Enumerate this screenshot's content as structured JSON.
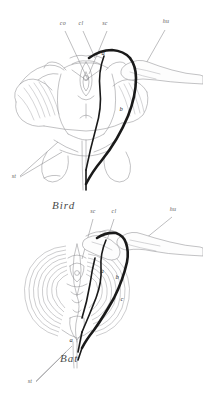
{
  "figure": {
    "title_visible": false,
    "kind": "comparative-anatomy-line-drawing",
    "background_color": "#ffffff",
    "line_color": "#8f8f93",
    "emphasis_color": "#1a1a1a",
    "text_color": "#4a4a4a",
    "panels": [
      {
        "id": "bird-panel",
        "caption": "Bird",
        "caption_pos": {
          "x": 52,
          "y": 208
        },
        "part_labels": [
          {
            "key": "co",
            "text": "co",
            "x": 63,
            "y": 25,
            "leader_to": {
              "x": 86,
              "y": 78
            }
          },
          {
            "key": "cl",
            "text": "cl",
            "x": 81,
            "y": 25,
            "leader_to": {
              "x": 93,
              "y": 56
            }
          },
          {
            "key": "sc",
            "text": "sc",
            "x": 105,
            "y": 25,
            "leader_to": {
              "x": 88,
              "y": 72
            }
          },
          {
            "key": "hu",
            "text": "hu",
            "x": 163,
            "y": 23,
            "leader_to": {
              "x": 141,
              "y": 72
            }
          },
          {
            "key": "st",
            "text": "st",
            "x": 13,
            "y": 176,
            "leader_to": {
              "x": 56,
              "y": 140
            }
          }
        ],
        "mark_labels": [
          {
            "key": "a",
            "text": "a",
            "x": 103,
            "y": 54
          },
          {
            "key": "b",
            "text": "b",
            "x": 121,
            "y": 110
          }
        ]
      },
      {
        "id": "bat-panel",
        "caption": "Bat",
        "caption_pos": {
          "x": 60,
          "y": 361
        },
        "part_labels": [
          {
            "key": "sc",
            "text": "sc",
            "x": 91,
            "y": 213,
            "leader_to": {
              "x": 80,
              "y": 258
            }
          },
          {
            "key": "cl",
            "text": "cl",
            "x": 112,
            "y": 213,
            "leader_to": {
              "x": 104,
              "y": 240
            }
          },
          {
            "key": "hu",
            "text": "hu",
            "x": 170,
            "y": 211,
            "leader_to": {
              "x": 139,
              "y": 240
            }
          },
          {
            "key": "st",
            "text": "st",
            "x": 29,
            "y": 381,
            "leader_to": {
              "x": 70,
              "y": 344
            }
          }
        ],
        "mark_labels": [
          {
            "key": "a",
            "text": "a",
            "x": 103,
            "y": 272
          },
          {
            "key": "b",
            "text": "b",
            "x": 117,
            "y": 278
          },
          {
            "key": "c",
            "text": "c",
            "x": 121,
            "y": 300
          },
          {
            "key": "a2",
            "text": "a",
            "x": 72,
            "y": 341
          }
        ]
      }
    ],
    "legend_keys": {
      "co": "coracoid",
      "cl": "clavicle",
      "sc": "scapula",
      "hu": "humerus",
      "st": "sternum"
    }
  }
}
